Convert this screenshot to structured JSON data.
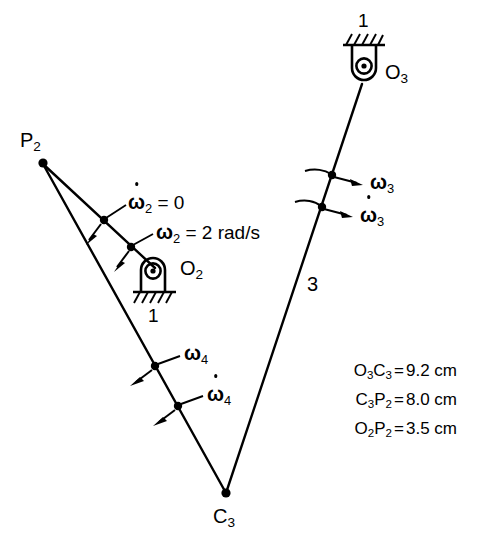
{
  "figure": {
    "background_color": "#ffffff",
    "stroke_color": "#000000"
  },
  "points": [
    {
      "id": "P2",
      "label": "P",
      "sub": "2",
      "x": 42,
      "y": 162
    },
    {
      "id": "O2",
      "label": "O",
      "sub": "2",
      "x": 152,
      "y": 266
    },
    {
      "id": "O3",
      "label": "O",
      "sub": "3",
      "x": 364,
      "y": 74
    },
    {
      "id": "C3",
      "label": "C",
      "sub": "3",
      "x": 226,
      "y": 494
    }
  ],
  "point_labels": {
    "p2": {
      "text": "P",
      "sub": "2"
    },
    "o2": {
      "text": "O",
      "sub": "2"
    },
    "o3": {
      "text": "O",
      "sub": "3"
    },
    "c3": {
      "text": "C",
      "sub": "3"
    }
  },
  "links": [
    {
      "name": "link-2",
      "from": "P2",
      "to": "O2",
      "number": "2"
    },
    {
      "name": "link-3",
      "from": "O3",
      "to": "C3",
      "number": "3"
    },
    {
      "name": "link-4",
      "from": "P2",
      "to": "C3",
      "number": "4"
    }
  ],
  "link_number_labels": {
    "link3": "3"
  },
  "ground_labels": {
    "top": "1",
    "bottom": "1"
  },
  "annotations": [
    {
      "name": "omega-dot-2",
      "symbol": "ω",
      "sub": "2",
      "dot": true,
      "equals": "= 0",
      "text": "ω̇₂ = 0"
    },
    {
      "name": "omega-2",
      "symbol": "ω",
      "sub": "2",
      "dot": false,
      "equals": "= 2 rad/s",
      "text": "ω₂ = 2 rad/s"
    },
    {
      "name": "omega-3",
      "symbol": "ω",
      "sub": "3",
      "dot": false,
      "equals": "",
      "text": "ω₃"
    },
    {
      "name": "omega-dot-3",
      "symbol": "ω",
      "sub": "3",
      "dot": true,
      "equals": "",
      "text": "ω̇₃"
    },
    {
      "name": "omega-4",
      "symbol": "ω",
      "sub": "4",
      "dot": false,
      "equals": "",
      "text": "ω₄"
    },
    {
      "name": "omega-dot-4",
      "symbol": "ω",
      "sub": "4",
      "dot": true,
      "equals": "",
      "text": "ω̇₄"
    }
  ],
  "omega_labels": {
    "omega_dot_2_sym": "ω",
    "omega_dot_2_sub": "2",
    "omega_dot_2_rhs": "= 0",
    "omega_2_sym": "ω",
    "omega_2_sub": "2",
    "omega_2_rhs": "= 2 rad/s",
    "omega_3_sym": "ω",
    "omega_3_sub": "3",
    "omega_dot_3_sym": "ω",
    "omega_dot_3_sub": "3",
    "omega_4_sym": "ω",
    "omega_4_sub": "4",
    "omega_dot_4_sym": "ω",
    "omega_dot_4_sub": "4"
  },
  "dimensions": {
    "rows": [
      {
        "a": "O",
        "a_sub": "3",
        "b": "C",
        "b_sub": "3",
        "eq": "=",
        "value": "9.2 cm",
        "full": "O3C3 = 9.2 cm"
      },
      {
        "a": "C",
        "a_sub": "3",
        "b": "P",
        "b_sub": "2",
        "eq": "=",
        "value": "8.0 cm",
        "full": "C3P2 = 8.0 cm"
      },
      {
        "a": "O",
        "a_sub": "2",
        "b": "P",
        "b_sub": "2",
        "eq": "=",
        "value": "3.5 cm",
        "full": "O2P2 = 3.5 cm"
      }
    ]
  },
  "dimension_text": {
    "row1_a": "O",
    "row1_a_sub": "3",
    "row1_b": "C",
    "row1_b_sub": "3",
    "row1_eq": "=",
    "row1_val": "9.2 cm",
    "row2_a": "C",
    "row2_a_sub": "3",
    "row2_b": "P",
    "row2_b_sub": "2",
    "row2_eq": "=",
    "row2_val": "8.0 cm",
    "row3_a": "O",
    "row3_a_sub": "2",
    "row3_b": "P",
    "row3_b_sub": "2",
    "row3_eq": "=",
    "row3_val": "3.5 cm"
  }
}
